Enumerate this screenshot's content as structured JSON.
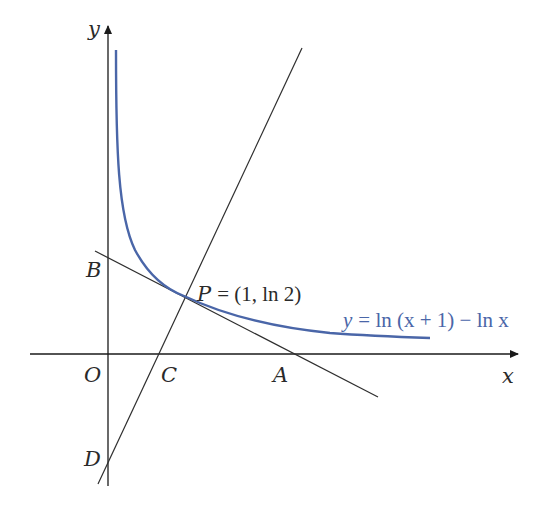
{
  "figure": {
    "axes": {
      "x_label": "x",
      "y_label": "y",
      "origin_label": "O"
    },
    "points": {
      "B": "B",
      "C": "C",
      "A": "A",
      "D": "D",
      "P_name": "P",
      "P_coords": "= (1, ln 2)"
    },
    "curve": {
      "equation_lhs": "y",
      "equation_rhs": "= ln (x + 1) − ln x",
      "color": "#4a66a8"
    },
    "line_color": "#2e2e2e",
    "axis_color": "#1a1a1a"
  }
}
